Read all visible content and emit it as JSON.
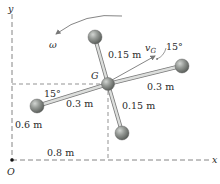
{
  "diagram": {
    "axes": {
      "x_label": "x",
      "y_label": "y",
      "origin_label": "O"
    },
    "center_label": "G",
    "angular_velocity_label": "ω",
    "velocity_label": "v",
    "velocity_subscript": "G",
    "dimensions": {
      "rod_top": "0.15 m",
      "rod_right": "0.3 m",
      "rod_left": "0.3 m",
      "rod_bottom": "0.15 m",
      "height_G": "0.6 m",
      "horizontal_G": "0.8 m"
    },
    "angles": {
      "left_angle": "15°",
      "velocity_angle": "15°"
    },
    "colors": {
      "ball": "#8a8f8a",
      "ball_highlight": "#c9ccc9",
      "rod": "#d8dad8",
      "rod_edge": "#7a7a7a",
      "dashed": "#666666",
      "arrow": "#777777"
    }
  }
}
